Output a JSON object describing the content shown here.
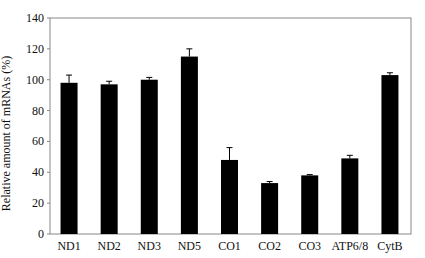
{
  "chart_data": {
    "type": "bar",
    "title": "",
    "xlabel": "",
    "ylabel": "Relative amount of mRNAs (%)",
    "ylim": [
      0,
      140
    ],
    "yticks": [
      0,
      20,
      40,
      60,
      80,
      100,
      120,
      140
    ],
    "grid": false,
    "legend": null,
    "categories": [
      "ND1",
      "ND2",
      "ND3",
      "ND5",
      "CO1",
      "CO2",
      "CO3",
      "ATP6/8",
      "CytB"
    ],
    "values": [
      98,
      97,
      100,
      115,
      48,
      33,
      38,
      49,
      103
    ],
    "errors": [
      5,
      2,
      1.5,
      5,
      8,
      1,
      0.5,
      2,
      1.5
    ],
    "bar_color": "#000000",
    "axis_color": "#888888"
  }
}
